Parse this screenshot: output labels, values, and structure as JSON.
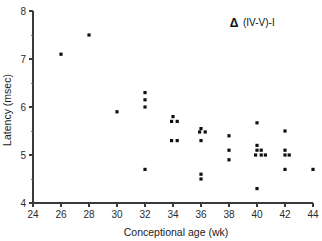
{
  "chart_data": {
    "type": "scatter",
    "title": "",
    "xlabel": "Conceptional age (wk)",
    "ylabel": "Latency (msec)",
    "xlim": [
      24,
      44
    ],
    "ylim": [
      4,
      8
    ],
    "xticks": [
      24,
      26,
      28,
      30,
      32,
      34,
      36,
      38,
      40,
      42,
      44
    ],
    "yticks": [
      4,
      5,
      6,
      7,
      8
    ],
    "xtick_labels": [
      "24",
      "26",
      "28",
      "30",
      "32",
      "34",
      "36",
      "38",
      "40",
      "42",
      "44"
    ],
    "ytick_labels": [
      "4",
      "5",
      "6",
      "7",
      "8"
    ],
    "x_minor_ticks": [],
    "y_minor_ticks": [
      4.5,
      5.5,
      6.5,
      7.5
    ],
    "grid": false,
    "legend_position": "top-right",
    "marker": "square",
    "marker_color": "#101010",
    "series": [
      {
        "name": "(IV-V)-I",
        "symbol": "Δ",
        "label": "(IV-V)-I",
        "points": [
          [
            26.0,
            7.1
          ],
          [
            28.0,
            7.5
          ],
          [
            30.0,
            5.9
          ],
          [
            32.0,
            6.3
          ],
          [
            32.0,
            6.15
          ],
          [
            32.0,
            6.0
          ],
          [
            32.0,
            4.7
          ],
          [
            34.0,
            5.8
          ],
          [
            33.9,
            5.7
          ],
          [
            34.3,
            5.7
          ],
          [
            33.9,
            5.3
          ],
          [
            34.3,
            5.3
          ],
          [
            36.0,
            5.55
          ],
          [
            35.9,
            5.48
          ],
          [
            36.3,
            5.48
          ],
          [
            36.0,
            5.3
          ],
          [
            36.0,
            4.6
          ],
          [
            36.0,
            4.5
          ],
          [
            38.0,
            5.4
          ],
          [
            38.0,
            5.1
          ],
          [
            38.0,
            4.9
          ],
          [
            40.0,
            5.67
          ],
          [
            40.0,
            5.2
          ],
          [
            40.0,
            5.1
          ],
          [
            40.3,
            5.1
          ],
          [
            39.9,
            5.0
          ],
          [
            40.3,
            5.0
          ],
          [
            40.6,
            5.0
          ],
          [
            40.0,
            4.3
          ],
          [
            42.0,
            5.5
          ],
          [
            42.0,
            5.1
          ],
          [
            42.0,
            5.0
          ],
          [
            42.3,
            5.0
          ],
          [
            42.0,
            4.7
          ],
          [
            44.0,
            4.7
          ]
        ]
      }
    ],
    "legend": [
      {
        "symbol": "Δ",
        "label": "(IV-V)-I"
      }
    ],
    "axis_color": "#3a3a3a",
    "background": "#ffffff"
  }
}
